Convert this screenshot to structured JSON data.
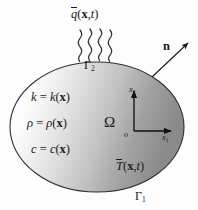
{
  "figure": {
    "background_color": "#fdfdfd"
  },
  "domain": {
    "name": "omega-region",
    "symbol": "Ω",
    "shape": "ellipse",
    "outline_color": "#2a2a2a",
    "fill_gradient_from": "#ffffff",
    "fill_gradient_to": "#8e8e8e",
    "bounds": {
      "cx": 97,
      "cy": 127,
      "rx": 87,
      "ry": 65
    }
  },
  "boundaries": {
    "neumann": {
      "label": "Γ",
      "subscript": "2",
      "description": "flux-boundary"
    },
    "dirichlet": {
      "label": "Γ",
      "subscript": "1",
      "description": "temperature-boundary"
    }
  },
  "flux": {
    "symbol": "q",
    "overbar": true,
    "args": "(",
    "arg_vector": "x",
    "arg_sep": ",",
    "arg_time": "t",
    "arg_close": ")",
    "full": "q(x,t)",
    "arrow_count": 4,
    "arrow_color": "#333333"
  },
  "prescribed_temperature": {
    "symbol": "T",
    "overbar": true,
    "args": "(",
    "arg_vector": "x",
    "arg_sep": ",",
    "arg_time": "t",
    "arg_close": ")",
    "full": "T(x,t)"
  },
  "normal_vector": {
    "symbol": "n",
    "bold": true,
    "arrow_from": {
      "x": 152,
      "y": 76
    },
    "arrow_to": {
      "x": 189,
      "y": 42
    },
    "color": "#1a1a1a"
  },
  "material_properties": [
    {
      "name": "conductivity",
      "lhs": "k",
      "eq": "=",
      "rhs_fn": "k",
      "rhs_open": "(",
      "rhs_arg": "x",
      "rhs_close": ")"
    },
    {
      "name": "density",
      "lhs": "ρ",
      "eq": "=",
      "rhs_fn": "ρ",
      "rhs_open": "(",
      "rhs_arg": "x",
      "rhs_close": ")"
    },
    {
      "name": "specific-heat",
      "lhs": "c",
      "eq": "=",
      "rhs_fn": "c",
      "rhs_open": "(",
      "rhs_arg": "x",
      "rhs_close": ")"
    }
  ],
  "axes": {
    "origin_label": "o",
    "vertical": {
      "label": "x",
      "subscript": "2"
    },
    "horizontal": {
      "label": "x",
      "subscript": "1"
    },
    "color": "#111111",
    "origin_point": {
      "x": 134,
      "y": 131
    },
    "vertical_tip": {
      "x": 134,
      "y": 89
    },
    "horizontal_tip": {
      "x": 172,
      "y": 131
    }
  }
}
